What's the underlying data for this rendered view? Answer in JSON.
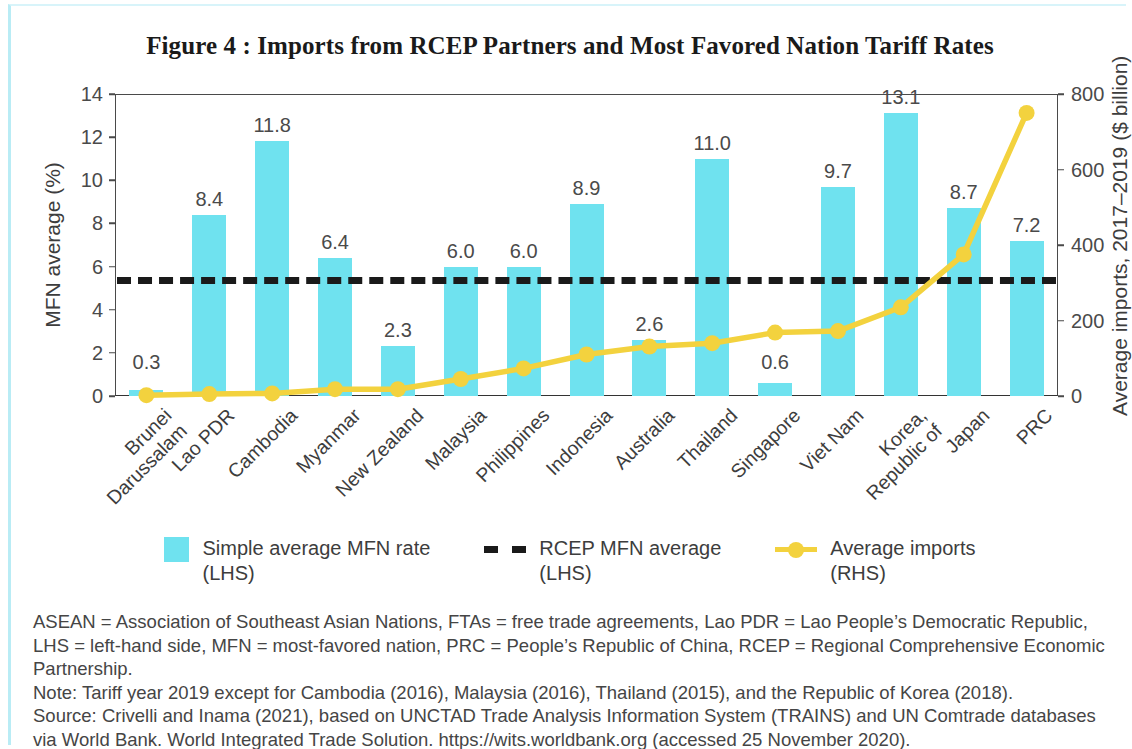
{
  "figure": {
    "title": "Figure 4 : Imports from RCEP Partners and Most Favored Nation Tariff Rates"
  },
  "axes": {
    "left_title": "MFN average (%)",
    "right_title": "Average imports, 2017–2019 ($ billion)",
    "left_ticks": [
      "0",
      "2",
      "4",
      "6",
      "8",
      "10",
      "12",
      "14"
    ],
    "right_ticks": [
      "0",
      "200",
      "400",
      "600",
      "800"
    ]
  },
  "legend": {
    "items": [
      {
        "marker": "bar-swatch",
        "line1": "Simple average MFN rate",
        "line2": "(LHS)"
      },
      {
        "marker": "dashed-line-swatch",
        "line1": "RCEP MFN average",
        "line2": "(LHS)"
      },
      {
        "marker": "yellow-line-swatch",
        "line1": "Average imports",
        "line2": "(RHS)"
      }
    ]
  },
  "notes": {
    "abbreviations": "ASEAN = Association of Southeast Asian Nations, FTAs = free trade agreements, Lao PDR = Lao People’s Democratic Republic, LHS = left-hand side, MFN = most-favored nation, PRC = People’s Republic of China, RCEP = Regional Comprehensive Economic Partnership.",
    "note": "Note: Tariff year 2019 except for Cambodia (2016), Malaysia (2016), Thailand (2015), and the Republic of Korea (2018).",
    "source": "Source: Crivelli and Inama (2021), based on UNCTAD Trade Analysis Information System (TRAINS) and UN Comtrade databases via World Bank. World Integrated Trade Solution. https://wits.worldbank.org (accessed 25 November 2020)."
  },
  "chart_data": {
    "type": "bar",
    "title": "Figure 4 : Imports from RCEP Partners and Most Favored Nation Tariff Rates",
    "xlabel": "",
    "ylabel": "MFN average (%)",
    "y2label": "Average imports, 2017–2019 ($ billion)",
    "ylim": [
      0,
      14
    ],
    "y2lim": [
      0,
      800
    ],
    "grid": false,
    "legend_position": "bottom",
    "categories": [
      "Brunei Darussalam",
      "Lao PDR",
      "Cambodia",
      "Myanmar",
      "New Zealand",
      "Malaysia",
      "Philippines",
      "Indonesia",
      "Australia",
      "Thailand",
      "Singapore",
      "Viet Nam",
      "Korea, Republic of",
      "Japan",
      "PRC"
    ],
    "category_lines": [
      [
        "Brunei",
        "Darussalam"
      ],
      [
        "Lao PDR"
      ],
      [
        "Cambodia"
      ],
      [
        "Myanmar"
      ],
      [
        "New Zealand"
      ],
      [
        "Malaysia"
      ],
      [
        "Philippines"
      ],
      [
        "Indonesia"
      ],
      [
        "Australia"
      ],
      [
        "Thailand"
      ],
      [
        "Singapore"
      ],
      [
        "Viet Nam"
      ],
      [
        "Korea,",
        "Republic of"
      ],
      [
        "Japan"
      ],
      [
        "PRC"
      ]
    ],
    "series": [
      {
        "name": "Simple average MFN rate (LHS)",
        "type": "bar",
        "axis": "left",
        "color": "#6FE2EF",
        "values": [
          0.3,
          8.4,
          11.8,
          6.4,
          2.3,
          6.0,
          6.0,
          8.9,
          2.6,
          11.0,
          0.6,
          9.7,
          13.1,
          8.7,
          7.2
        ],
        "labels": [
          "0.3",
          "8.4",
          "11.8",
          "6.4",
          "2.3",
          "6.0",
          "6.0",
          "8.9",
          "2.6",
          "11.0",
          "0.6",
          "9.7",
          "13.1",
          "8.7",
          "7.2"
        ]
      },
      {
        "name": "RCEP MFN average (LHS)",
        "type": "line",
        "style": "dashed",
        "axis": "left",
        "color": "#1A1A1A",
        "value": 5.5
      },
      {
        "name": "Average imports (RHS)",
        "type": "line",
        "axis": "right",
        "color": "#F3D23E",
        "values": [
          2,
          5,
          7,
          18,
          18,
          45,
          73,
          110,
          131,
          140,
          168,
          172,
          235,
          375,
          750
        ]
      }
    ]
  }
}
